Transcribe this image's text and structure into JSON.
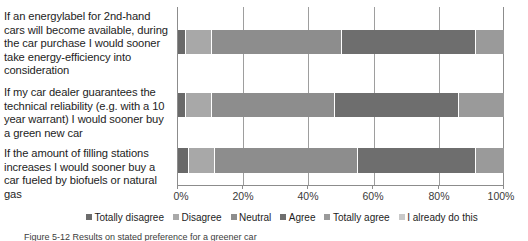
{
  "chart_data": {
    "type": "bar",
    "orientation": "horizontal",
    "stacked": true,
    "normalized_percent": true,
    "title": "",
    "xlabel": "",
    "ylabel": "",
    "xlim": [
      0,
      100
    ],
    "xticks": [
      "0%",
      "20%",
      "40%",
      "60%",
      "80%",
      "100%"
    ],
    "xtick_values": [
      0,
      20,
      40,
      60,
      80,
      100
    ],
    "grid": true,
    "legend_position": "bottom",
    "categories": [
      "If an energylabel for 2nd-hand cars will become available, during the car purchase I would sooner take energy-efficiency into consideration",
      "If my car dealer guarantees the technical reliability (e.g. with a 10 year warrant) I would sooner buy a green new car",
      "If the amount of filling stations increases I would sooner buy a car fueled by biofuels or natural gas"
    ],
    "series": [
      {
        "name": "Totally disagree",
        "color": "#696969",
        "values": [
          2,
          2,
          3
        ]
      },
      {
        "name": "Disagree",
        "color": "#a8a8a8",
        "values": [
          8,
          8,
          8
        ]
      },
      {
        "name": "Neutral",
        "color": "#8d8d8d",
        "values": [
          40,
          38,
          44
        ]
      },
      {
        "name": "Agree",
        "color": "#6e6e6e",
        "values": [
          41,
          38,
          36
        ]
      },
      {
        "name": "Totally agree",
        "color": "#9a9a9a",
        "values": [
          9,
          14,
          9
        ]
      },
      {
        "name": "I already do this",
        "color": "#c9c9c9",
        "values": [
          0,
          0,
          0
        ]
      }
    ]
  },
  "legend": {
    "items": [
      {
        "label": "Totally disagree",
        "color": "#6c6c6c"
      },
      {
        "label": "Disagree",
        "color": "#a9a9a9"
      },
      {
        "label": "Neutral",
        "color": "#8d8d8d"
      },
      {
        "label": "Agree",
        "color": "#6e6e6e"
      },
      {
        "label": "Totally agree",
        "color": "#9a9a9a"
      },
      {
        "label": "I already do this",
        "color": "#c9c9c9"
      }
    ]
  },
  "caption": {
    "text": "Figure 5-12 Results on stated preference for a greener car"
  }
}
